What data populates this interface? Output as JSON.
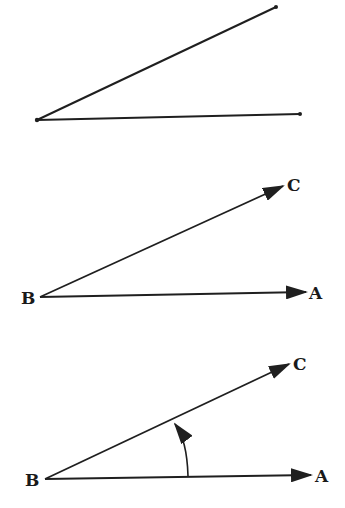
{
  "colors": {
    "stroke": "#1f1f1f",
    "background": "#ffffff"
  },
  "figures": [
    {
      "id": "figure-1",
      "description": "Two line segments from a common endpoint forming an angle",
      "labels": {}
    },
    {
      "id": "figure-2",
      "description": "Two rays BA and BC from vertex B",
      "labels": {
        "vertex": "B",
        "ray1": "A",
        "ray2": "C"
      }
    },
    {
      "id": "figure-3",
      "description": "Rays BA and BC with curved arrow indicating rotation from BA to BC",
      "labels": {
        "vertex": "B",
        "ray1": "A",
        "ray2": "C"
      }
    }
  ]
}
